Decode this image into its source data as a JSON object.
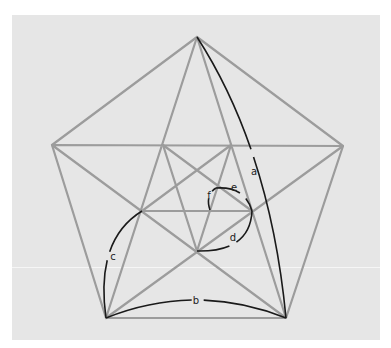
{
  "diagram": {
    "title": "",
    "type": "pentagon-pentagram-golden-spiral",
    "colors": {
      "background": "#e6e6e6",
      "page": "#ffffff",
      "geometry_lines": "#9c9c9c",
      "arcs": "#1a1a1a",
      "labels": "#222222"
    },
    "outer_pentagon": [
      [
        197,
        37
      ],
      [
        343,
        146
      ],
      [
        286,
        318
      ],
      [
        106,
        318
      ],
      [
        52,
        145
      ]
    ],
    "inner_pentagon": [
      [
        163,
        145
      ],
      [
        231,
        145
      ],
      [
        252,
        211
      ],
      [
        197,
        251
      ],
      [
        142,
        211
      ]
    ],
    "arcs": [
      {
        "label": "a",
        "from": [
          197,
          37
        ],
        "to": [
          286,
          318
        ],
        "label_pos": [
          254,
          172
        ]
      },
      {
        "label": "b",
        "from": [
          106,
          318
        ],
        "to": [
          286,
          318
        ],
        "label_pos": [
          196,
          301
        ]
      },
      {
        "label": "c",
        "from": [
          106,
          318
        ],
        "to": [
          142,
          211
        ],
        "label_pos": [
          113,
          257
        ]
      },
      {
        "label": "d",
        "from": [
          197,
          251
        ],
        "to": [
          252,
          211
        ],
        "label_pos": [
          233,
          238
        ]
      },
      {
        "label": "e",
        "from": [
          216,
          188
        ],
        "to": [
          252,
          211
        ],
        "label_pos": [
          234,
          188
        ]
      },
      {
        "label": "f",
        "from": [
          210,
          210
        ],
        "to": [
          216,
          188
        ],
        "label_pos": [
          209,
          196
        ]
      }
    ]
  },
  "labels": {
    "a": "a",
    "b": "b",
    "c": "c",
    "d": "d",
    "e": "e",
    "f": "f"
  }
}
